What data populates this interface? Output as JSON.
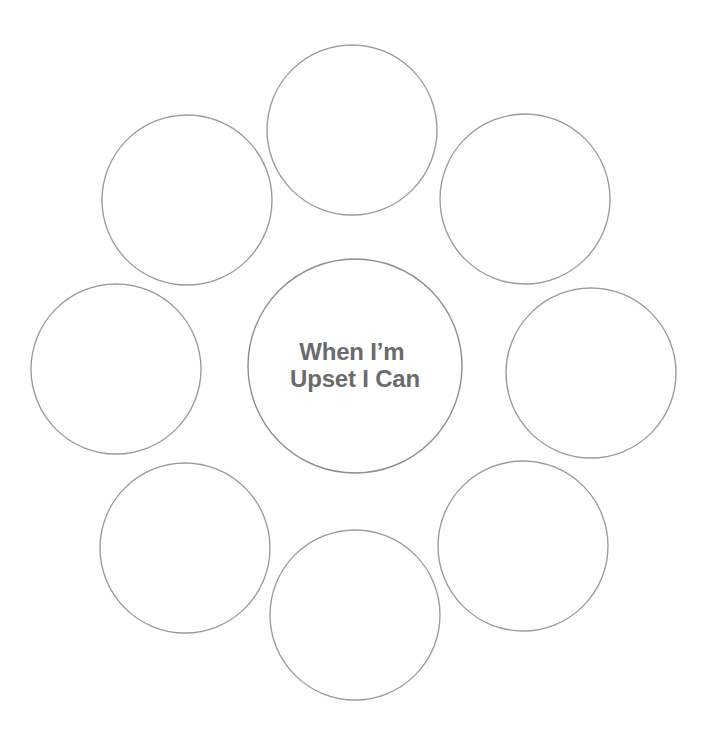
{
  "worksheet": {
    "canvas": {
      "width": 706,
      "height": 738,
      "background": "#ffffff"
    },
    "center": {
      "prompt_line_1": "When I’m",
      "prompt_line_2": "Upset I Can",
      "text_color": "#6b6b6b",
      "stroke_color": "#8e8e8e",
      "cx": 355,
      "cy": 366,
      "r": 107
    },
    "petals": {
      "stroke_color": "#9a9a9a",
      "fill_color": "#ffffff",
      "radius": 85,
      "count": 8,
      "items": [
        {
          "position": "top",
          "label": "",
          "cx": 352,
          "cy": 130
        },
        {
          "position": "upper-right",
          "label": "",
          "cx": 525,
          "cy": 199
        },
        {
          "position": "right",
          "label": "",
          "cx": 591,
          "cy": 373
        },
        {
          "position": "lower-right",
          "label": "",
          "cx": 523,
          "cy": 546
        },
        {
          "position": "bottom",
          "label": "",
          "cx": 355,
          "cy": 615
        },
        {
          "position": "lower-left",
          "label": "",
          "cx": 185,
          "cy": 548
        },
        {
          "position": "left",
          "label": "",
          "cx": 116,
          "cy": 369
        },
        {
          "position": "upper-left",
          "label": "",
          "cx": 187,
          "cy": 200
        }
      ]
    }
  }
}
